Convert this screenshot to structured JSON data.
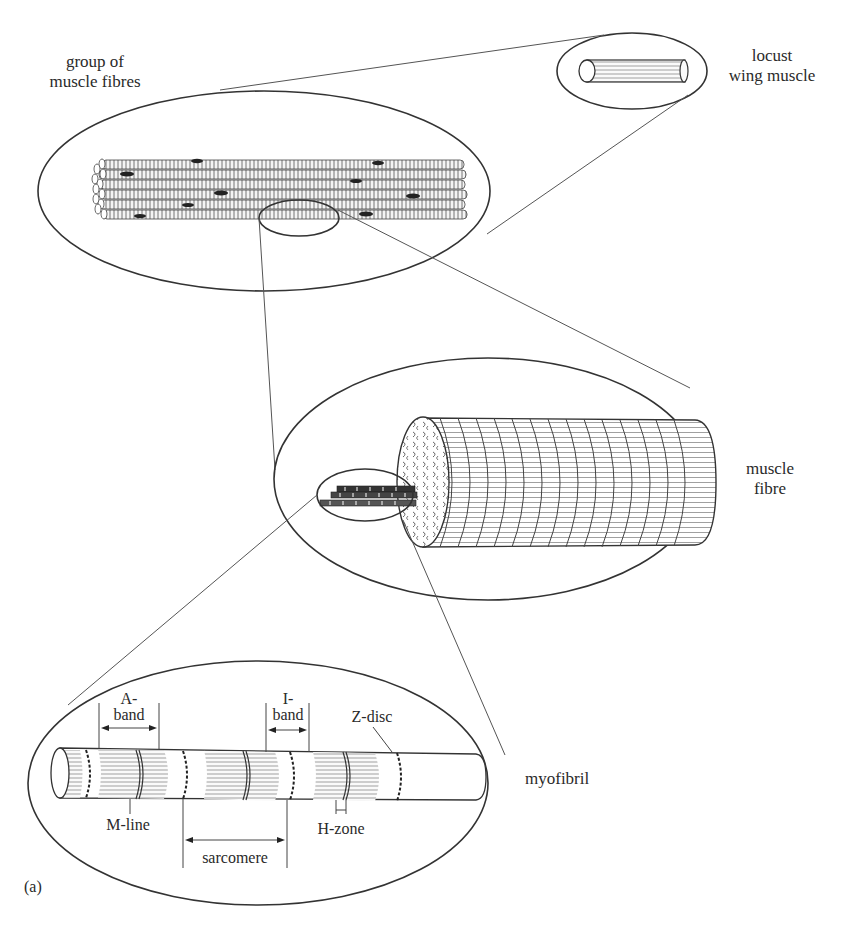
{
  "figure": {
    "panel_label": "(a)"
  },
  "levels": [
    {
      "id": "locust",
      "label_line1": "locust",
      "label_line2": "wing muscle"
    },
    {
      "id": "group",
      "label_line1": "group of",
      "label_line2": "muscle fibres"
    },
    {
      "id": "fibre",
      "label_line1": "muscle",
      "label_line2": "fibre"
    },
    {
      "id": "myofibril",
      "label_line1": "myofibril"
    }
  ],
  "myofibril_labels": {
    "a_band_1": "A-",
    "a_band_2": "band",
    "i_band_1": "I-",
    "i_band_2": "band",
    "z_disc": "Z-disc",
    "m_line": "M-line",
    "h_zone": "H-zone",
    "sarcomere": "sarcomere"
  },
  "colors": {
    "line": "#333333",
    "text": "#2a2a2a",
    "background": "#ffffff"
  }
}
